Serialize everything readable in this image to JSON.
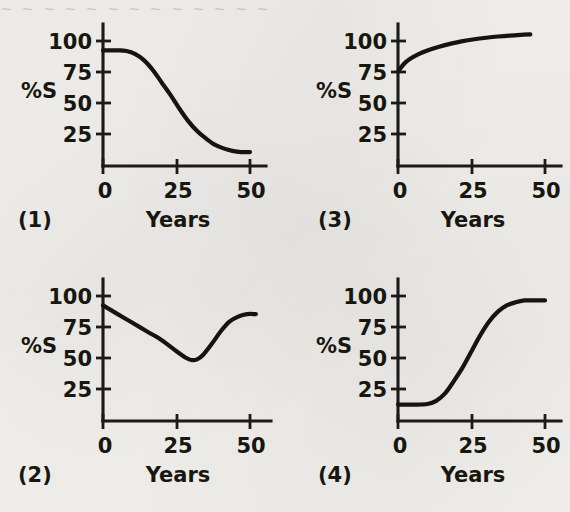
{
  "figure": {
    "background_color": "#f2f0ed",
    "ink_color": "#15140f",
    "bleed_text": "~ ~ ~ ~ ~ ~ ~ ~ ~ ~ ~ ~ ~"
  },
  "axes_labels": {
    "y_axis_title": "%S",
    "x_axis_title": "Years",
    "y_ticks": [
      "100",
      "75",
      "50",
      "25"
    ],
    "x_ticks": [
      "0",
      "25",
      "50"
    ]
  },
  "panels": [
    {
      "id": "(1)",
      "position": "top-left",
      "y_title": "%S",
      "x_title": "Years"
    },
    {
      "id": "(3)",
      "position": "top-right",
      "y_title": "%S",
      "x_title": "Years"
    },
    {
      "id": "(2)",
      "position": "bottom-left",
      "y_title": "%S",
      "x_title": "Years"
    },
    {
      "id": "(4)",
      "position": "bottom-right",
      "y_title": "%S",
      "x_title": "Years"
    }
  ],
  "chart_data": [
    {
      "type": "line",
      "title": "(1)",
      "xlabel": "Years",
      "ylabel": "%S",
      "xlim": [
        0,
        55
      ],
      "ylim": [
        0,
        110
      ],
      "xticks": [
        0,
        25,
        50
      ],
      "yticks": [
        25,
        50,
        75,
        100
      ],
      "grid": false,
      "legend": "none",
      "description": "Type I survivorship: high survival then steep late decline (reverse sigmoid)",
      "x": [
        0,
        5,
        8,
        11,
        14,
        17,
        20,
        23,
        26,
        29,
        32,
        35,
        38,
        41,
        44,
        47,
        50
      ],
      "y": [
        92,
        92,
        91.5,
        89,
        84,
        76,
        66,
        56,
        45,
        35,
        27,
        21,
        16,
        13,
        11,
        10,
        10
      ]
    },
    {
      "type": "line",
      "title": "(3)",
      "xlabel": "Years",
      "ylabel": "%S",
      "xlim": [
        0,
        55
      ],
      "ylim": [
        0,
        110
      ],
      "xticks": [
        0,
        25,
        50
      ],
      "yticks": [
        25,
        50,
        75,
        100
      ],
      "grid": false,
      "legend": "none",
      "description": "Logarithmic rise from 75% at year 0 flattening near 105% by year 45",
      "x": [
        0,
        2,
        4,
        7,
        10,
        14,
        18,
        22,
        26,
        30,
        34,
        38,
        42,
        45
      ],
      "y": [
        75,
        81,
        85,
        89,
        92,
        95,
        97.5,
        99.5,
        101,
        102.2,
        103.2,
        104,
        104.6,
        105
      ]
    },
    {
      "type": "line",
      "title": "(2)",
      "xlabel": "Years",
      "ylabel": "%S",
      "xlim": [
        0,
        55
      ],
      "ylim": [
        0,
        110
      ],
      "xticks": [
        0,
        25,
        50
      ],
      "yticks": [
        25,
        50,
        75,
        100
      ],
      "grid": false,
      "legend": "none",
      "description": "Linear decline to a minimum near year 30, then sharp recovery to a plateau",
      "x": [
        0,
        5,
        10,
        15,
        20,
        25,
        28,
        30,
        32,
        34,
        37,
        40,
        43,
        46,
        49,
        52
      ],
      "y": [
        92,
        85,
        78,
        71,
        64,
        55,
        50,
        48,
        48.5,
        52,
        61,
        71,
        79,
        83,
        85,
        85
      ]
    },
    {
      "type": "line",
      "title": "(4)",
      "xlabel": "Years",
      "ylabel": "%S",
      "xlim": [
        0,
        55
      ],
      "ylim": [
        0,
        110
      ],
      "xticks": [
        0,
        25,
        50
      ],
      "yticks": [
        25,
        50,
        75,
        100
      ],
      "grid": false,
      "legend": "none",
      "description": "Sigmoid rise from about 12% to a plateau near 96% crossing 50% at year 25",
      "x": [
        0,
        5,
        10,
        13,
        16,
        19,
        22,
        25,
        28,
        31,
        34,
        37,
        40,
        43,
        46,
        50
      ],
      "y": [
        12,
        12,
        12.5,
        15,
        21,
        31,
        42,
        55,
        68,
        79,
        87,
        92,
        94.5,
        96,
        96,
        96
      ]
    }
  ]
}
